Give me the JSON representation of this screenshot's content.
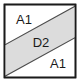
{
  "diagram": {
    "type": "layer-cross-section",
    "canvas": {
      "width": 81,
      "height": 83
    },
    "frame": {
      "name": "outer-square",
      "x": 4.5,
      "y": 4.5,
      "width": 71,
      "height": 73,
      "fill_color": "#ffffff",
      "stroke_color": "#1a1a1a",
      "stroke_width": 1.6
    },
    "band": {
      "name": "diagonal-band",
      "label": "D2",
      "fill_color": "#dcdcdc",
      "stroke_color": "#4d4d4d",
      "stroke_width": 1.1,
      "orientation": "bottom-left-to-top-right",
      "polygon_points": "4.5,45 4.5,76.5 75.5,37.5 75.5,6"
    },
    "regions": [
      {
        "name": "upper-left-region",
        "label": "A1",
        "fill_color": "#ffffff",
        "label_x": 24,
        "label_y": 21
      },
      {
        "name": "band-region",
        "label": "D2",
        "fill_color": "#dcdcdc",
        "label_x": 41,
        "label_y": 44
      },
      {
        "name": "lower-right-region",
        "label": "A1",
        "fill_color": "#ffffff",
        "label_x": 58,
        "label_y": 65
      }
    ]
  }
}
